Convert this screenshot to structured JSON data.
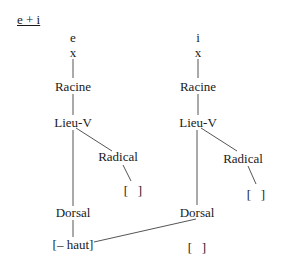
{
  "title": "e + i",
  "trees": [
    {
      "segment": "e",
      "skeleton": "x",
      "root": "Racine",
      "place": "Lieu-V",
      "radical": "Radical",
      "radical_value": "[   ]",
      "dorsal": "Dorsal",
      "dorsal_value": "[– haut]"
    },
    {
      "segment": "i",
      "skeleton": "x",
      "root": "Racine",
      "place": "Lieu-V",
      "radical": "Radical",
      "radical_value": "[   ]",
      "dorsal": "Dorsal",
      "dorsal_value": "[   ]"
    }
  ],
  "colors": {
    "text": "#1a1a1a",
    "line": "#555555",
    "background": "#ffffff"
  }
}
